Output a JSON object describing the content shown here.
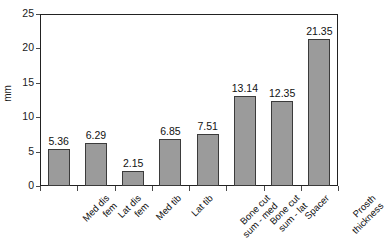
{
  "chart_data": {
    "type": "bar",
    "title": "",
    "xlabel": "",
    "ylabel": "mm",
    "ylim": [
      0,
      25
    ],
    "yticks": [
      0,
      5,
      10,
      15,
      20,
      25
    ],
    "grid": false,
    "legend": null,
    "categories": [
      "Med dis\nfem",
      "Lat dis\nfem",
      "Med tib",
      "Lat tib",
      "Bone cut\nsum - med",
      "Bone cut\nsum - lat",
      "Spacer",
      "Prosth\nthickness"
    ],
    "values": [
      5.36,
      6.29,
      2.15,
      6.85,
      7.51,
      13.14,
      12.35,
      21.35
    ],
    "data_labels": [
      "5.36",
      "6.29",
      "2.15",
      "6.85",
      "7.51",
      "13.14",
      "12.35",
      "21.35"
    ],
    "bar_color": "#9b9b9b",
    "bar_edge_color": "#3b3b3b",
    "axis_color": "#222222",
    "background": "#ffffff"
  }
}
